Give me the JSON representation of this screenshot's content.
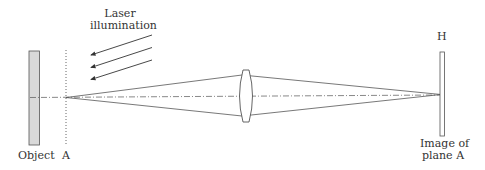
{
  "labels": {
    "laser_line1": "Laser",
    "laser_line2": "illumination",
    "object": "Object",
    "plane_a": "A",
    "hologram": "H",
    "image_line1": "Image of",
    "image_line2": "plane A"
  },
  "colors": {
    "stroke": "#444444",
    "object_fill": "#d9d9d9",
    "text": "#333333"
  }
}
